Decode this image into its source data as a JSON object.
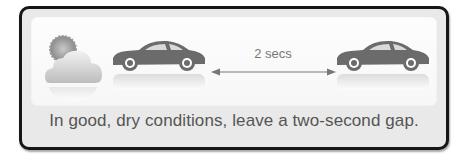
{
  "diagram": {
    "gap_label": "2 secs",
    "caption": "In good, dry conditions, leave a two-second gap.",
    "icons": [
      "weather-sun-cloud-icon",
      "car-icon",
      "double-arrow-icon",
      "car-icon"
    ],
    "colors": {
      "frame": "#161616",
      "panel": "#fdfdfd",
      "caption_bg": "#e9e9e9",
      "car": "#6b6b6b",
      "text": "#555555"
    }
  }
}
